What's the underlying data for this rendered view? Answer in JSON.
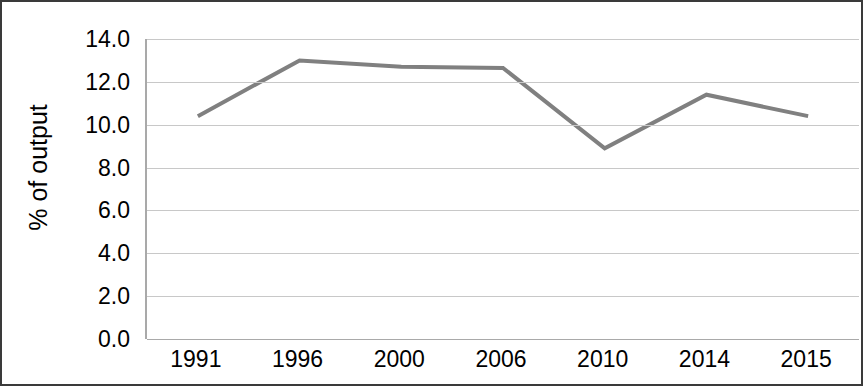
{
  "chart_data": {
    "type": "line",
    "title": "",
    "subtitle": "",
    "xlabel": "",
    "ylabel": "% of output",
    "categories": [
      "1991",
      "1996",
      "2000",
      "2006",
      "2010",
      "2014",
      "2015"
    ],
    "values": [
      10.4,
      13.0,
      12.7,
      12.65,
      8.9,
      11.4,
      10.4
    ],
    "series": [
      {
        "name": "",
        "values": [
          10.4,
          13.0,
          12.7,
          12.65,
          8.9,
          11.4,
          10.4
        ]
      }
    ],
    "ylim": [
      0.0,
      14.0
    ],
    "ytick_values": [
      0.0,
      2.0,
      4.0,
      6.0,
      8.0,
      10.0,
      12.0,
      14.0
    ],
    "ytick_labels": [
      "0.0",
      "2.0",
      "4.0",
      "6.0",
      "8.0",
      "10.0",
      "12.0",
      "14.0"
    ],
    "grid": true,
    "grid_axis": "y",
    "legend": false,
    "legend_position": "none",
    "markers": false,
    "annotations": [],
    "colors": {
      "line": "#808080",
      "gridline": "#c8c8c8",
      "axis": "#a9a9a9",
      "text": "#000000",
      "frame": "#3a3a3a",
      "background": "#ffffff"
    },
    "line_width": 4
  }
}
